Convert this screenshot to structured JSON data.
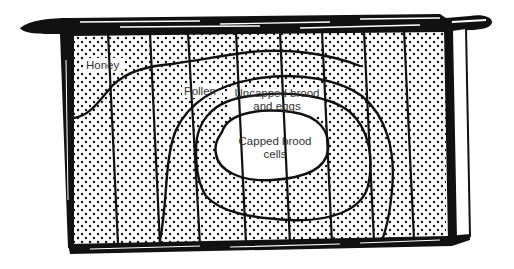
{
  "diagram": {
    "labels": {
      "honey": "Honey",
      "pollen": "Pollen",
      "uncapped_line1": "Uncapped brood",
      "uncapped_line2": "and eggs",
      "capped_line1": "Capped brood",
      "capped_line2": "cells"
    },
    "colors": {
      "ink": "#111111",
      "paper": "#ffffff",
      "label_text": "#333333"
    },
    "zones": [
      "Honey",
      "Pollen",
      "Uncapped brood and eggs",
      "Capped brood cells"
    ]
  }
}
